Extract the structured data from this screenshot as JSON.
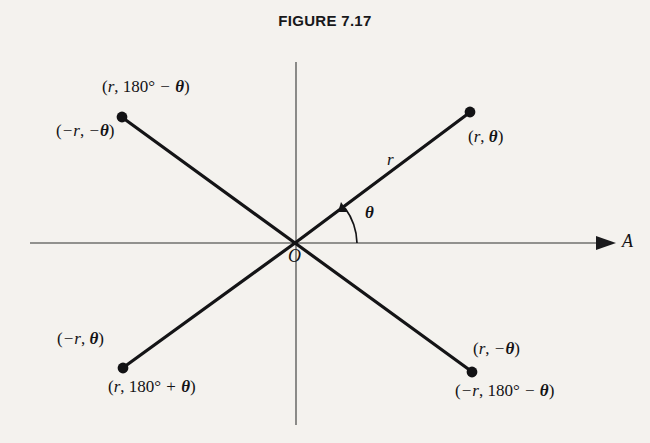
{
  "figure": {
    "title": "FIGURE 7.17",
    "origin_label": "O",
    "axis_label": "A",
    "radius_label": "r",
    "angle_label": "θ"
  },
  "labels": {
    "upper_left_primary": "(r, 180° − θ)",
    "upper_left_secondary": "(−r, −θ)",
    "upper_right_primary": "(r, θ)",
    "lower_left_primary": "(−r, θ)",
    "lower_left_secondary": "(r, 180° + θ)",
    "lower_right_primary": "(r, −θ)",
    "lower_right_secondary": "(−r, 180° − θ)"
  },
  "chart_data": {
    "type": "scatter",
    "title": "FIGURE 7.17",
    "xlabel": "A",
    "ylabel": "",
    "grid": false,
    "legend": "none",
    "origin": {
      "label": "O",
      "x": 295,
      "y": 243
    },
    "axes": [
      {
        "name": "polar-axis-horizontal",
        "label": "A",
        "from": [
          30,
          243
        ],
        "to": [
          612,
          243
        ],
        "arrow": true
      },
      {
        "name": "vertical-axis",
        "label": "",
        "from": [
          296,
          62
        ],
        "to": [
          296,
          425
        ],
        "arrow": false
      }
    ],
    "rays": [
      {
        "name": "ray-upper-right",
        "from": [
          295,
          243
        ],
        "to": [
          470,
          112
        ],
        "label": "r"
      },
      {
        "name": "ray-upper-left",
        "from": [
          295,
          243
        ],
        "to": [
          122,
          117
        ],
        "label": ""
      },
      {
        "name": "ray-lower-left",
        "from": [
          295,
          243
        ],
        "to": [
          123,
          368
        ],
        "label": ""
      },
      {
        "name": "ray-lower-right",
        "from": [
          295,
          243
        ],
        "to": [
          472,
          372
        ],
        "label": ""
      }
    ],
    "points": [
      {
        "name": "point-upper-left",
        "x": 122,
        "y": 117,
        "labels": [
          "(r, 180° − θ)",
          "(−r, −θ)"
        ]
      },
      {
        "name": "point-upper-right",
        "x": 470,
        "y": 112,
        "labels": [
          "(r, θ)"
        ]
      },
      {
        "name": "point-lower-left",
        "x": 123,
        "y": 368,
        "labels": [
          "(−r, θ)",
          "(r, 180° + θ)"
        ]
      },
      {
        "name": "point-lower-right",
        "x": 472,
        "y": 372,
        "labels": [
          "(r, −θ)",
          "(−r, 180° − θ)"
        ]
      }
    ],
    "angle_arc": {
      "name": "angle-theta",
      "label": "θ",
      "vertex": [
        295,
        243
      ],
      "from_deg": 0,
      "to_deg": 37
    }
  }
}
